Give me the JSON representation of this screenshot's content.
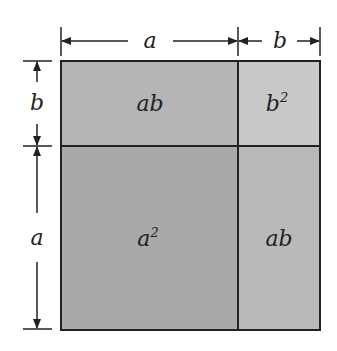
{
  "diagram": {
    "title": "",
    "dimensions": {
      "top": [
        {
          "label": "a",
          "from": "left",
          "to": "divider"
        },
        {
          "label": "b",
          "from": "divider",
          "to": "right"
        }
      ],
      "left": [
        {
          "label": "b",
          "from": "top",
          "to": "divider"
        },
        {
          "label": "a",
          "from": "divider",
          "to": "bottom"
        }
      ]
    },
    "regions": [
      {
        "id": "top-left",
        "label": "ab",
        "base": "ab",
        "sup": "",
        "color": "#b5b5b5"
      },
      {
        "id": "top-right",
        "label": "b²",
        "base": "b",
        "sup": "2",
        "color": "#c9c9c9"
      },
      {
        "id": "bottom-left",
        "label": "a²",
        "base": "a",
        "sup": "2",
        "color": "#a9a9a9"
      },
      {
        "id": "bottom-right",
        "label": "ab",
        "base": "ab",
        "sup": "",
        "color": "#b9b9b9"
      }
    ],
    "dim_labels": {
      "top_a": "a",
      "top_b": "b",
      "left_b": "b",
      "left_a": "a"
    },
    "colors": {
      "line": "#222222",
      "background": "#ffffff"
    }
  }
}
